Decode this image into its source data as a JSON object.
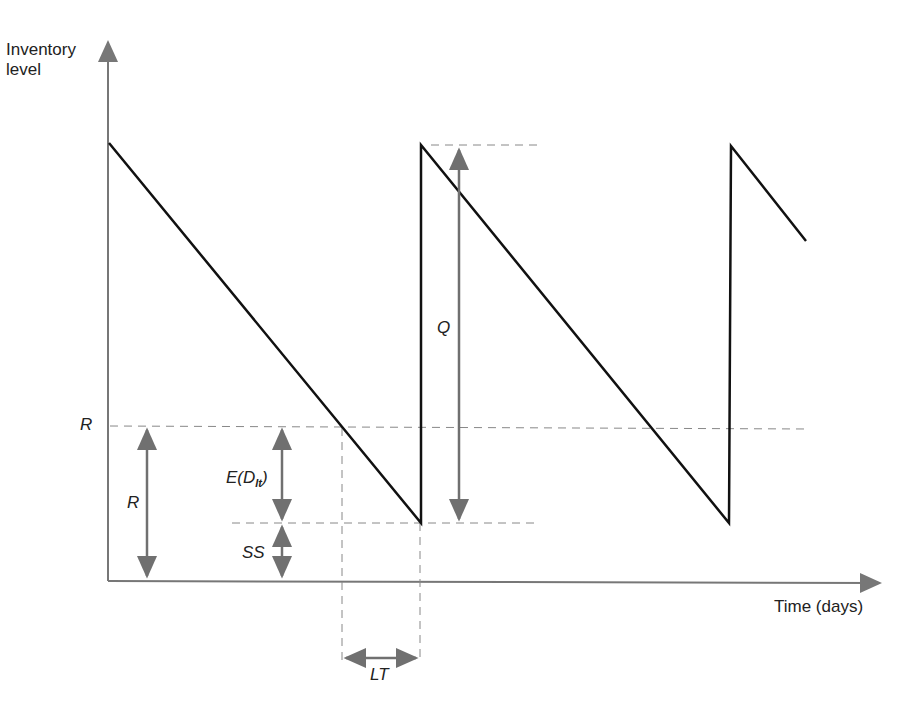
{
  "diagram": {
    "y_axis_label_line1": "Inventory",
    "y_axis_label_line2": "level",
    "x_axis_label": "Time (days)",
    "labels": {
      "R_axis": "R",
      "R_arrow": "R",
      "expected_demand": "E(D",
      "expected_demand_sub": "lt",
      "expected_demand_close": ")",
      "safety_stock": "SS",
      "order_quantity": "Q",
      "lead_time": "LT"
    },
    "colors": {
      "inventory_line": "#111111",
      "axis": "#777777",
      "dashed": "#888888",
      "arrow": "#707070",
      "text": "#222222"
    },
    "inventory_path": [
      [
        109,
        143
      ],
      [
        421,
        523
      ],
      [
        421,
        145
      ],
      [
        729,
        523
      ],
      [
        731,
        146
      ],
      [
        806,
        241
      ]
    ]
  }
}
